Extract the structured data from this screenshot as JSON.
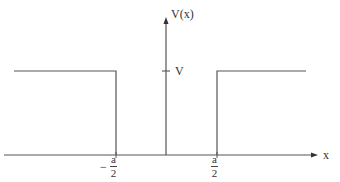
{
  "diagram": {
    "y_axis_label": "V(x)",
    "x_axis_label": "x",
    "potential_level_label": "V",
    "left_edge": {
      "sign": "−",
      "numerator": "a",
      "denominator": "2"
    },
    "right_edge": {
      "numerator": "a",
      "denominator": "2"
    },
    "colors": {
      "line": "#555555",
      "text": "#333333",
      "background": "#ffffff"
    }
  }
}
